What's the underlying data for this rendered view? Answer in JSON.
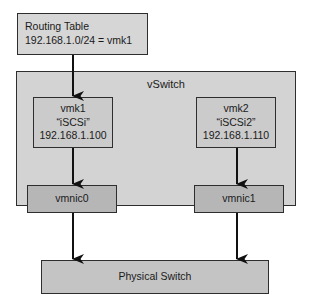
{
  "routing_table": {
    "title": "Routing Table",
    "entry": "192.168.1.0/24 = vmk1"
  },
  "vswitch": {
    "label": "vSwitch",
    "vmk": [
      {
        "name": "vmk1",
        "portgroup": "“iSCSi”",
        "ip": "192.168.1.100"
      },
      {
        "name": "vmk2",
        "portgroup": "“iSCSi2”",
        "ip": "192.168.1.110"
      }
    ],
    "vmnics": [
      {
        "name": "vmnic0"
      },
      {
        "name": "vmnic1"
      }
    ]
  },
  "physical_switch": {
    "label": "Physical Switch"
  },
  "colors": {
    "border": "#2e2e2e",
    "vswitch_fill": "#d3d3d3",
    "vmnic_fill": "#b6b6b6",
    "physical_fill": "#c4c4c4"
  }
}
